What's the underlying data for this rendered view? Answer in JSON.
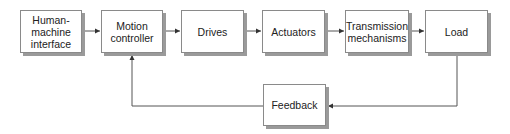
{
  "diagram": {
    "type": "block-diagram",
    "colors": {
      "line": "#555555",
      "border": "#8a8a8a",
      "shadow": "#9a9a9a",
      "text": "#222222"
    },
    "nodes": [
      {
        "id": "hmi",
        "label": "Human-\nmachine\ninterface"
      },
      {
        "id": "motion_controller",
        "label": "Motion\ncontroller"
      },
      {
        "id": "drives",
        "label": "Drives"
      },
      {
        "id": "actuators",
        "label": "Actuators"
      },
      {
        "id": "transmission",
        "label": "Transmission\nmechanisms"
      },
      {
        "id": "load",
        "label": "Load"
      },
      {
        "id": "feedback",
        "label": "Feedback"
      }
    ],
    "edges": [
      {
        "from": "hmi",
        "to": "motion_controller"
      },
      {
        "from": "motion_controller",
        "to": "drives"
      },
      {
        "from": "drives",
        "to": "actuators"
      },
      {
        "from": "actuators",
        "to": "transmission"
      },
      {
        "from": "transmission",
        "to": "load"
      },
      {
        "from": "load",
        "to": "feedback"
      },
      {
        "from": "feedback",
        "to": "motion_controller"
      }
    ]
  }
}
